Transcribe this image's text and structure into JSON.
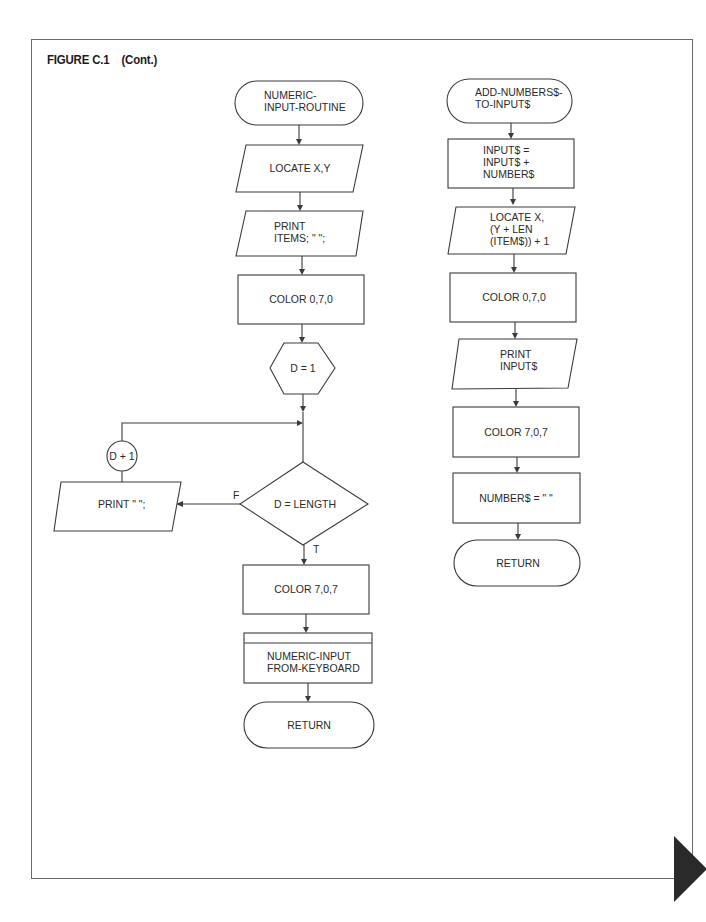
{
  "figure": {
    "title": "FIGURE C.1    (Cont.)"
  },
  "flowchart_left": {
    "start": {
      "type": "terminal",
      "lines": [
        "NUMERIC-",
        "INPUT-ROUTINE"
      ]
    },
    "n1": {
      "type": "io",
      "lines": [
        "LOCATE X,Y"
      ]
    },
    "n2": {
      "type": "io",
      "lines": [
        "PRINT",
        "ITEMS; \" \";"
      ]
    },
    "n3": {
      "type": "process",
      "lines": [
        "COLOR 0,7,0"
      ]
    },
    "n4": {
      "type": "preparation",
      "lines": [
        "D = 1"
      ]
    },
    "decision": {
      "type": "decision",
      "lines": [
        "D = LENGTH"
      ],
      "false_label": "F",
      "true_label": "T"
    },
    "false_branch": {
      "type": "io",
      "lines": [
        "PRINT \" \";"
      ]
    },
    "increment": {
      "type": "connector",
      "lines": [
        "D + 1"
      ]
    },
    "n5": {
      "type": "process",
      "lines": [
        "COLOR 7,0,7"
      ]
    },
    "n6": {
      "type": "predefined-process",
      "lines": [
        "NUMERIC-INPUT",
        "FROM-KEYBOARD"
      ]
    },
    "end": {
      "type": "terminal",
      "lines": [
        "RETURN"
      ]
    }
  },
  "flowchart_right": {
    "start": {
      "type": "terminal",
      "lines": [
        "ADD-NUMBERS$-",
        "TO-INPUT$"
      ]
    },
    "n1": {
      "type": "process",
      "lines": [
        "INPUT$ =",
        "INPUT$ +",
        "NUMBER$"
      ]
    },
    "n2": {
      "type": "io",
      "lines": [
        "LOCATE X,",
        "(Y + LEN",
        "(ITEM$)) + 1"
      ]
    },
    "n3": {
      "type": "process",
      "lines": [
        "COLOR 0,7,0"
      ]
    },
    "n4": {
      "type": "io",
      "lines": [
        "PRINT",
        "INPUT$"
      ]
    },
    "n5": {
      "type": "process",
      "lines": [
        "COLOR 7,0,7"
      ]
    },
    "n6": {
      "type": "process",
      "lines": [
        "NUMBER$ = \" \""
      ]
    },
    "end": {
      "type": "terminal",
      "lines": [
        "RETURN"
      ]
    }
  },
  "page_tab": {
    "color": "#2a2a2a"
  }
}
